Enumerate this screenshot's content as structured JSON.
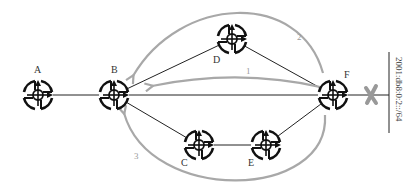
{
  "diagram": {
    "nodes": [
      {
        "id": "A",
        "label": "A",
        "x": 38,
        "y": 95
      },
      {
        "id": "B",
        "label": "B",
        "x": 114,
        "y": 95
      },
      {
        "id": "C",
        "label": "C",
        "x": 199,
        "y": 145
      },
      {
        "id": "D",
        "label": "D",
        "x": 232,
        "y": 39
      },
      {
        "id": "E",
        "label": "E",
        "x": 266,
        "y": 145
      },
      {
        "id": "F",
        "label": "F",
        "x": 333,
        "y": 95
      }
    ],
    "links": [
      [
        "A",
        "B"
      ],
      [
        "B",
        "D"
      ],
      [
        "B",
        "F"
      ],
      [
        "B",
        "C"
      ],
      [
        "C",
        "E"
      ],
      [
        "D",
        "F"
      ],
      [
        "E",
        "F"
      ]
    ],
    "failed_link": {
      "label": "x-mark",
      "color": "#999999"
    },
    "prefix_label": "2001:db8:0:2::/64",
    "reroute_paths": [
      {
        "number": "1",
        "from": "F",
        "to": "B",
        "via": "direct"
      },
      {
        "number": "2",
        "from": "F",
        "to": "B",
        "via": "D"
      },
      {
        "number": "3",
        "from": "F",
        "to": "B",
        "via": "C-E"
      }
    ],
    "colors": {
      "link": "#222222",
      "reroute_arrow": "#a8a8a8",
      "router_icon": "#111111"
    }
  }
}
